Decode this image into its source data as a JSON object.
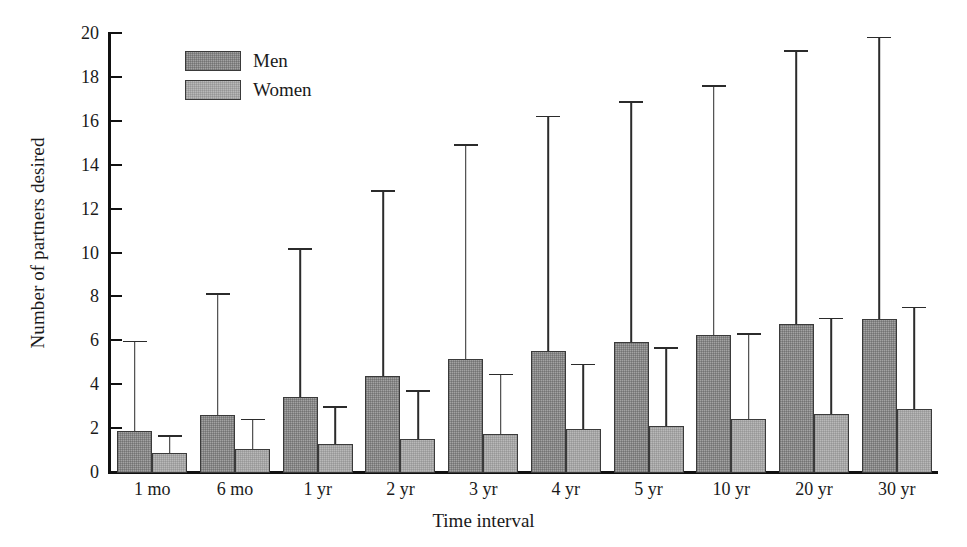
{
  "chart_data": {
    "type": "bar",
    "title": "",
    "xlabel": "Time interval",
    "ylabel": "Number of partners desired",
    "ylim": [
      0,
      20
    ],
    "ytick_step": 2,
    "yticks": [
      0,
      2,
      4,
      6,
      8,
      10,
      12,
      14,
      16,
      18,
      20
    ],
    "ytick_labels": [
      "0",
      "2",
      "4",
      "6",
      "8",
      "10",
      "12",
      "14",
      "16",
      "18",
      "20"
    ],
    "grid": false,
    "legend_position": "upper-left-inside",
    "error_bars": "upper only (mean + SD)",
    "categories": [
      "1 mo",
      "6 mo",
      "1 yr",
      "2 yr",
      "3 yr",
      "4 yr",
      "5 yr",
      "10 yr",
      "20 yr",
      "30 yr"
    ],
    "series": [
      {
        "name": "Men",
        "color": "#a3a3a3",
        "values": [
          1.9,
          2.65,
          3.45,
          4.4,
          5.2,
          5.55,
          5.95,
          6.3,
          6.8,
          7.0
        ],
        "error_upper": [
          5.95,
          8.1,
          10.15,
          12.8,
          14.9,
          16.2,
          16.85,
          17.6,
          19.2,
          19.8
        ]
      },
      {
        "name": "Women",
        "color": "#b9b9b9",
        "values": [
          0.9,
          1.1,
          1.3,
          1.55,
          1.8,
          2.0,
          2.15,
          2.45,
          2.7,
          2.9
        ],
        "error_upper": [
          1.65,
          2.4,
          2.95,
          3.7,
          4.45,
          4.9,
          5.65,
          6.3,
          7.0,
          7.5
        ]
      }
    ]
  },
  "legend": {
    "items": [
      {
        "label": "Men",
        "swatch": "men"
      },
      {
        "label": "Women",
        "swatch": "women"
      }
    ]
  }
}
